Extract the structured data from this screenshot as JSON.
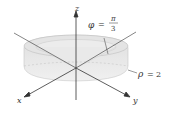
{
  "diagram": {
    "type": "3d-spherical-region",
    "axes": {
      "x_label": "x",
      "y_label": "y",
      "z_label": "z"
    },
    "annotations": {
      "phi_symbol": "φ",
      "phi_equals": "=",
      "phi_numerator": "π",
      "phi_denominator": "3",
      "rho_symbol": "ρ",
      "rho_equals": "=",
      "rho_value": "2"
    },
    "colors": {
      "solid_fill": "#e6e6e6",
      "solid_top": "#d9d9d9",
      "axis": "#333333"
    }
  }
}
